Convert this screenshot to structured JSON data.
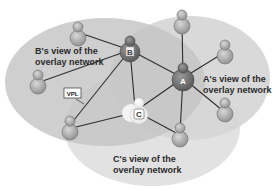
{
  "diagram": {
    "regions": [
      {
        "id": "b-view",
        "label_line1": "B's view of the",
        "label_line2": "overlay network"
      },
      {
        "id": "a-view",
        "label_line1": "A's view of the",
        "label_line2": "overlay network"
      },
      {
        "id": "c-view",
        "label_line1": "C's view of the",
        "label_line2": "overlay network"
      }
    ],
    "key_nodes": {
      "a": {
        "label": "A"
      },
      "b": {
        "label": "B"
      },
      "c": {
        "label": "C"
      }
    },
    "callout": {
      "label": "VPL"
    },
    "colors": {
      "b_region": "#c4c4c4",
      "a_region": "#d6d6d6",
      "c_region": "#e2e2e2",
      "key_node": "#7a7a7a",
      "peer_node": "#a9a9a9",
      "edge": "#2e2e2e"
    }
  }
}
